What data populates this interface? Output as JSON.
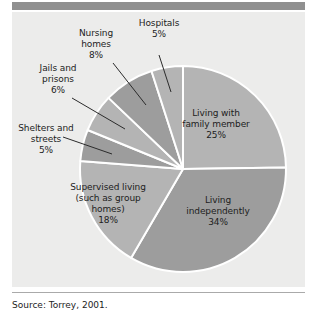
{
  "figure": {
    "background_color": "#ececeb",
    "header_bar_color": "#909090",
    "source_note": "Source: Torrey, 2001."
  },
  "chart_data": {
    "type": "pie",
    "title": "",
    "subtitle": "",
    "xlabel": "",
    "ylabel": "",
    "units": "percent",
    "legend_position": "none",
    "grid": false,
    "start_angle_deg": 0,
    "direction": "clockwise",
    "categories": [
      "Living with family member",
      "Living independently",
      "Supervised living (such as group homes)",
      "Shelters and streets",
      "Jails and prisons",
      "Nursing homes",
      "Hospitals"
    ],
    "values": [
      25,
      34,
      18,
      5,
      6,
      8,
      5
    ],
    "slices": [
      {
        "name": "living-with-family-member",
        "label": "Living with\nfamily member\n25%",
        "label_text": "Living with family member",
        "value": 25,
        "value_label": "25%",
        "color": "#b4b4b4",
        "label_placement": "inside",
        "leader_line": false
      },
      {
        "name": "living-independently",
        "label": "Living\nindependently\n34%",
        "label_text": "Living independently",
        "value": 34,
        "value_label": "34%",
        "color": "#9d9d9d",
        "label_placement": "inside",
        "leader_line": false
      },
      {
        "name": "supervised-living",
        "label": "Supervised living\n(such as group\nhomes)\n18%",
        "label_text": "Supervised living (such as group homes)",
        "value": 18,
        "value_label": "18%",
        "color": "#b4b4b4",
        "label_placement": "inside",
        "leader_line": false
      },
      {
        "name": "shelters-and-streets",
        "label": "Shelters and\nstreets\n5%",
        "label_text": "Shelters and streets",
        "value": 5,
        "value_label": "5%",
        "color": "#9d9d9d",
        "label_placement": "outside",
        "leader_line": true
      },
      {
        "name": "jails-and-prisons",
        "label": "Jails and\nprisons\n6%",
        "label_text": "Jails and prisons",
        "value": 6,
        "value_label": "6%",
        "color": "#b4b4b4",
        "label_placement": "outside",
        "leader_line": true
      },
      {
        "name": "nursing-homes",
        "label": "Nursing\nhomes\n8%",
        "label_text": "Nursing homes",
        "value": 8,
        "value_label": "8%",
        "color": "#9d9d9d",
        "label_placement": "outside",
        "leader_line": true
      },
      {
        "name": "hospitals",
        "label": "Hospitals\n5%",
        "label_text": "Hospitals",
        "value": 5,
        "value_label": "5%",
        "color": "#b4b4b4",
        "label_placement": "outside",
        "leader_line": true
      }
    ]
  }
}
